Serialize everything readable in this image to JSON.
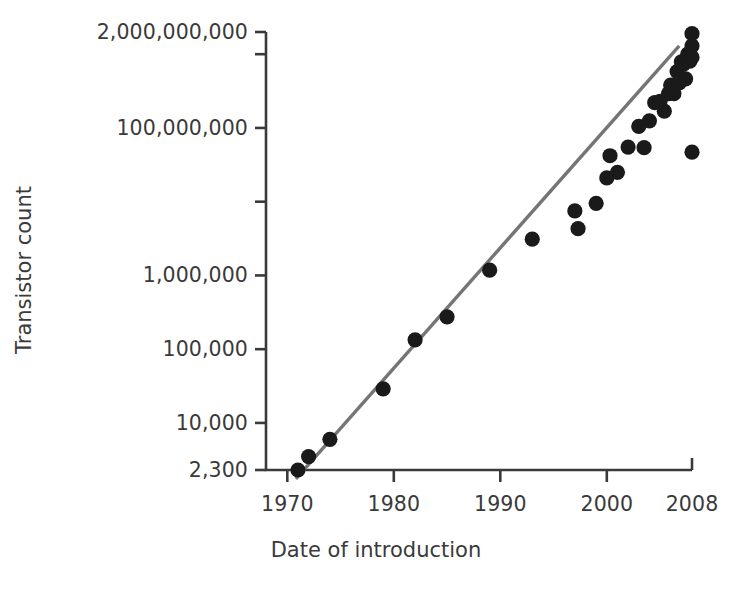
{
  "chart_data": {
    "type": "scatter",
    "title": "",
    "subtitle": "",
    "xlabel": "Date of introduction",
    "ylabel": "Transistor count",
    "grid": false,
    "legend": null,
    "yscale": "log",
    "xscale": "linear",
    "xlim": [
      1968,
      2008
    ],
    "ylim": [
      2300,
      2000000000
    ],
    "xticks": [
      1970,
      1980,
      1990,
      2000,
      2008
    ],
    "xtick_labels": [
      "1970",
      "1980",
      "1990",
      "2000",
      "2008"
    ],
    "yticks": [
      2300,
      10000,
      100000,
      1000000,
      10000000,
      100000000,
      1000000000,
      2000000000
    ],
    "ytick_labels": [
      "2,300",
      "10,000",
      "100,000",
      "1,000,000",
      "",
      "100,000,000",
      "",
      "2,000,000,000"
    ],
    "marker_color": "#1a1a1a",
    "trendline_color": "#757575",
    "axis_color": "#3a3a3a",
    "background": "#ffffff",
    "points": [
      {
        "x": 1971.0,
        "y": 2300
      },
      {
        "x": 1972.0,
        "y": 3500
      },
      {
        "x": 1974.0,
        "y": 6000
      },
      {
        "x": 1979.0,
        "y": 29000
      },
      {
        "x": 1982.0,
        "y": 134000
      },
      {
        "x": 1985.0,
        "y": 275000
      },
      {
        "x": 1989.0,
        "y": 1180000
      },
      {
        "x": 1993.0,
        "y": 3100000
      },
      {
        "x": 1997.0,
        "y": 7500000
      },
      {
        "x": 1997.3,
        "y": 4300000
      },
      {
        "x": 1999.0,
        "y": 9500000
      },
      {
        "x": 2000.0,
        "y": 21000000
      },
      {
        "x": 2000.3,
        "y": 42000000
      },
      {
        "x": 2001.0,
        "y": 25000000
      },
      {
        "x": 2002.0,
        "y": 55000000
      },
      {
        "x": 2003.0,
        "y": 105000000
      },
      {
        "x": 2003.5,
        "y": 54000000
      },
      {
        "x": 2004.0,
        "y": 125000000
      },
      {
        "x": 2004.5,
        "y": 220000000
      },
      {
        "x": 2005.0,
        "y": 230000000
      },
      {
        "x": 2005.4,
        "y": 169000000
      },
      {
        "x": 2005.8,
        "y": 291000000
      },
      {
        "x": 2006.0,
        "y": 380000000
      },
      {
        "x": 2006.3,
        "y": 291000000
      },
      {
        "x": 2006.6,
        "y": 582000000
      },
      {
        "x": 2006.8,
        "y": 410000000
      },
      {
        "x": 2007.0,
        "y": 789000000
      },
      {
        "x": 2007.2,
        "y": 731000000
      },
      {
        "x": 2007.4,
        "y": 463000000
      },
      {
        "x": 2007.6,
        "y": 1000000000
      },
      {
        "x": 2007.8,
        "y": 805000000
      },
      {
        "x": 2008.0,
        "y": 1900000000
      },
      {
        "x": 2008.0,
        "y": 1300000000
      },
      {
        "x": 2008.0,
        "y": 904000000
      },
      {
        "x": 2008.0,
        "y": 47000000
      }
    ],
    "trendline": {
      "label": "",
      "x_start": 1970.8,
      "y_start": 1750,
      "x_end": 2006.8,
      "y_end": 1300000000
    },
    "annotations": []
  }
}
